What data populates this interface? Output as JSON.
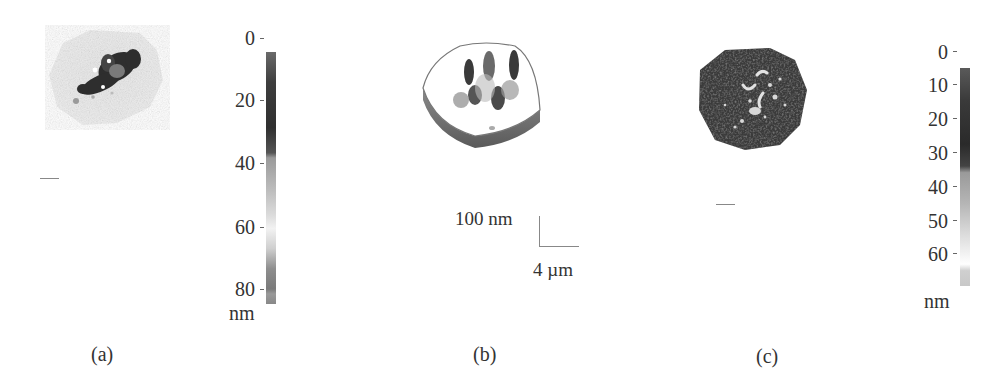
{
  "figure": {
    "panels": [
      {
        "id": "a",
        "caption": "(a)",
        "view": "2D top-down topography",
        "colorbar": {
          "ticks": [
            "0",
            "20",
            "40",
            "60",
            "80"
          ],
          "unit": "nm",
          "gradient": "linear-gradient(to bottom,#6a6a6a 0%,#3e3e3e 12%,#2f2f2f 30%,#555 40%,#9a9a9a 42%,#bdbdbd 55%,#dcdcdc 65%,#f2f2f2 70%,#cfcfcf 78%,#8e8e8e 86%,#7a7a7a 94%,#9a9a9a 96%,#888 100%)"
        }
      },
      {
        "id": "b",
        "caption": "(b)",
        "view": "3D perspective topography",
        "axes": {
          "z_scale": "100 nm",
          "xy_scale": "4 µm"
        }
      },
      {
        "id": "c",
        "caption": "(c)",
        "view": "2D top-down topography",
        "colorbar": {
          "ticks": [
            "0",
            "10",
            "20",
            "30",
            "40",
            "50",
            "60"
          ],
          "unit": "nm",
          "gradient": "linear-gradient(to bottom,#5a5a5a 0%,#3a3a3a 15%,#2a2a2a 35%,#444 45%,#9a9a9a 48%,#b5b5b5 62%,#d8d8d8 75%,#f4f4f4 86%,#ffffff 90%,#cfcfcf 93%,#c8c8c8 100%)"
        }
      }
    ]
  }
}
